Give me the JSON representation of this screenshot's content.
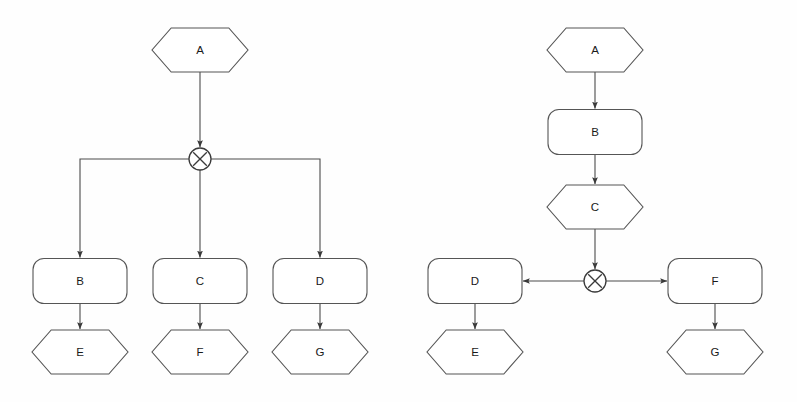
{
  "canvas": {
    "width": 797,
    "height": 402,
    "background_color": "#fefefe",
    "stroke_color": "#555555",
    "text_color": "#1a1a1a"
  },
  "diagrams": [
    {
      "id": "left-diagram",
      "name": "fan-out-from-operator",
      "nodes": [
        {
          "id": "l-a",
          "label": "A",
          "shape": "hexagon",
          "cx": 200,
          "cy": 50,
          "w": 96,
          "h": 44
        },
        {
          "id": "l-x",
          "label": "×",
          "shape": "operator-circle",
          "cx": 200,
          "cy": 159,
          "r": 11
        },
        {
          "id": "l-b",
          "label": "B",
          "shape": "rounded-rect",
          "cx": 80,
          "cy": 281,
          "w": 94,
          "h": 45
        },
        {
          "id": "l-c",
          "label": "C",
          "shape": "rounded-rect",
          "cx": 200,
          "cy": 281,
          "w": 94,
          "h": 45
        },
        {
          "id": "l-d",
          "label": "D",
          "shape": "rounded-rect",
          "cx": 320,
          "cy": 281,
          "w": 94,
          "h": 45
        },
        {
          "id": "l-e",
          "label": "E",
          "shape": "hexagon",
          "cx": 80,
          "cy": 352,
          "w": 96,
          "h": 44
        },
        {
          "id": "l-f",
          "label": "F",
          "shape": "hexagon",
          "cx": 200,
          "cy": 352,
          "w": 96,
          "h": 44
        },
        {
          "id": "l-g",
          "label": "G",
          "shape": "hexagon",
          "cx": 320,
          "cy": 352,
          "w": 96,
          "h": 44
        }
      ],
      "edges": [
        {
          "id": "l-e1",
          "from": "l-a",
          "to": "l-x",
          "kind": "vertical-arrow"
        },
        {
          "id": "l-e2",
          "from": "l-x",
          "to": "l-b",
          "kind": "elbow-left-arrow"
        },
        {
          "id": "l-e3",
          "from": "l-x",
          "to": "l-c",
          "kind": "vertical-arrow"
        },
        {
          "id": "l-e4",
          "from": "l-x",
          "to": "l-d",
          "kind": "elbow-right-arrow"
        },
        {
          "id": "l-e5",
          "from": "l-b",
          "to": "l-e",
          "kind": "vertical-arrow"
        },
        {
          "id": "l-e6",
          "from": "l-c",
          "to": "l-f",
          "kind": "vertical-arrow"
        },
        {
          "id": "l-e7",
          "from": "l-d",
          "to": "l-g",
          "kind": "vertical-arrow"
        }
      ]
    },
    {
      "id": "right-diagram",
      "name": "chain-then-fan-out",
      "nodes": [
        {
          "id": "r-a",
          "label": "A",
          "shape": "hexagon",
          "cx": 595,
          "cy": 50,
          "w": 96,
          "h": 44
        },
        {
          "id": "r-b",
          "label": "B",
          "shape": "rounded-rect",
          "cx": 595,
          "cy": 132,
          "w": 94,
          "h": 45
        },
        {
          "id": "r-c",
          "label": "C",
          "shape": "hexagon",
          "cx": 595,
          "cy": 207,
          "w": 96,
          "h": 44
        },
        {
          "id": "r-x",
          "label": "×",
          "shape": "operator-circle",
          "cx": 595,
          "cy": 281,
          "r": 11
        },
        {
          "id": "r-d",
          "label": "D",
          "shape": "rounded-rect",
          "cx": 475,
          "cy": 281,
          "w": 94,
          "h": 45
        },
        {
          "id": "r-f",
          "label": "F",
          "shape": "rounded-rect",
          "cx": 715,
          "cy": 281,
          "w": 94,
          "h": 45
        },
        {
          "id": "r-e",
          "label": "E",
          "shape": "hexagon",
          "cx": 475,
          "cy": 352,
          "w": 96,
          "h": 44
        },
        {
          "id": "r-g",
          "label": "G",
          "shape": "hexagon",
          "cx": 715,
          "cy": 352,
          "w": 96,
          "h": 44
        }
      ],
      "edges": [
        {
          "id": "r-e1",
          "from": "r-a",
          "to": "r-b",
          "kind": "vertical-arrow"
        },
        {
          "id": "r-e2",
          "from": "r-b",
          "to": "r-c",
          "kind": "vertical-arrow"
        },
        {
          "id": "r-e3",
          "from": "r-c",
          "to": "r-x",
          "kind": "vertical-arrow"
        },
        {
          "id": "r-e4",
          "from": "r-x",
          "to": "r-d",
          "kind": "horizontal-left-arrow"
        },
        {
          "id": "r-e5",
          "from": "r-x",
          "to": "r-f",
          "kind": "horizontal-right-arrow"
        },
        {
          "id": "r-e6",
          "from": "r-d",
          "to": "r-e",
          "kind": "vertical-arrow"
        },
        {
          "id": "r-e7",
          "from": "r-f",
          "to": "r-g",
          "kind": "vertical-arrow"
        }
      ]
    }
  ]
}
